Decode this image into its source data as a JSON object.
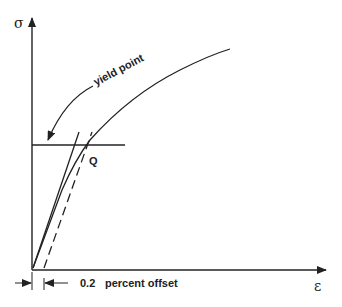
{
  "diagram": {
    "y_axis_symbol": "σ",
    "x_axis_symbol": "ε",
    "annotations": {
      "yield_point": "yield point",
      "intersection": "Q",
      "offset_value": "0.2",
      "offset_label": "percent offset"
    },
    "colors": {
      "line": "#222222",
      "background": "#ffffff"
    }
  }
}
